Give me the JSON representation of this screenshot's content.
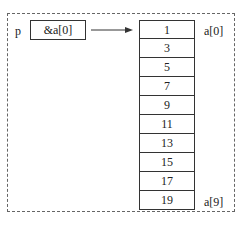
{
  "pointer": {
    "name": "p",
    "value": "&a[0]"
  },
  "array": {
    "values": [
      "1",
      "3",
      "5",
      "7",
      "9",
      "11",
      "13",
      "15",
      "17",
      "19"
    ],
    "first_label": "a[0]",
    "last_label": "a[9]"
  }
}
